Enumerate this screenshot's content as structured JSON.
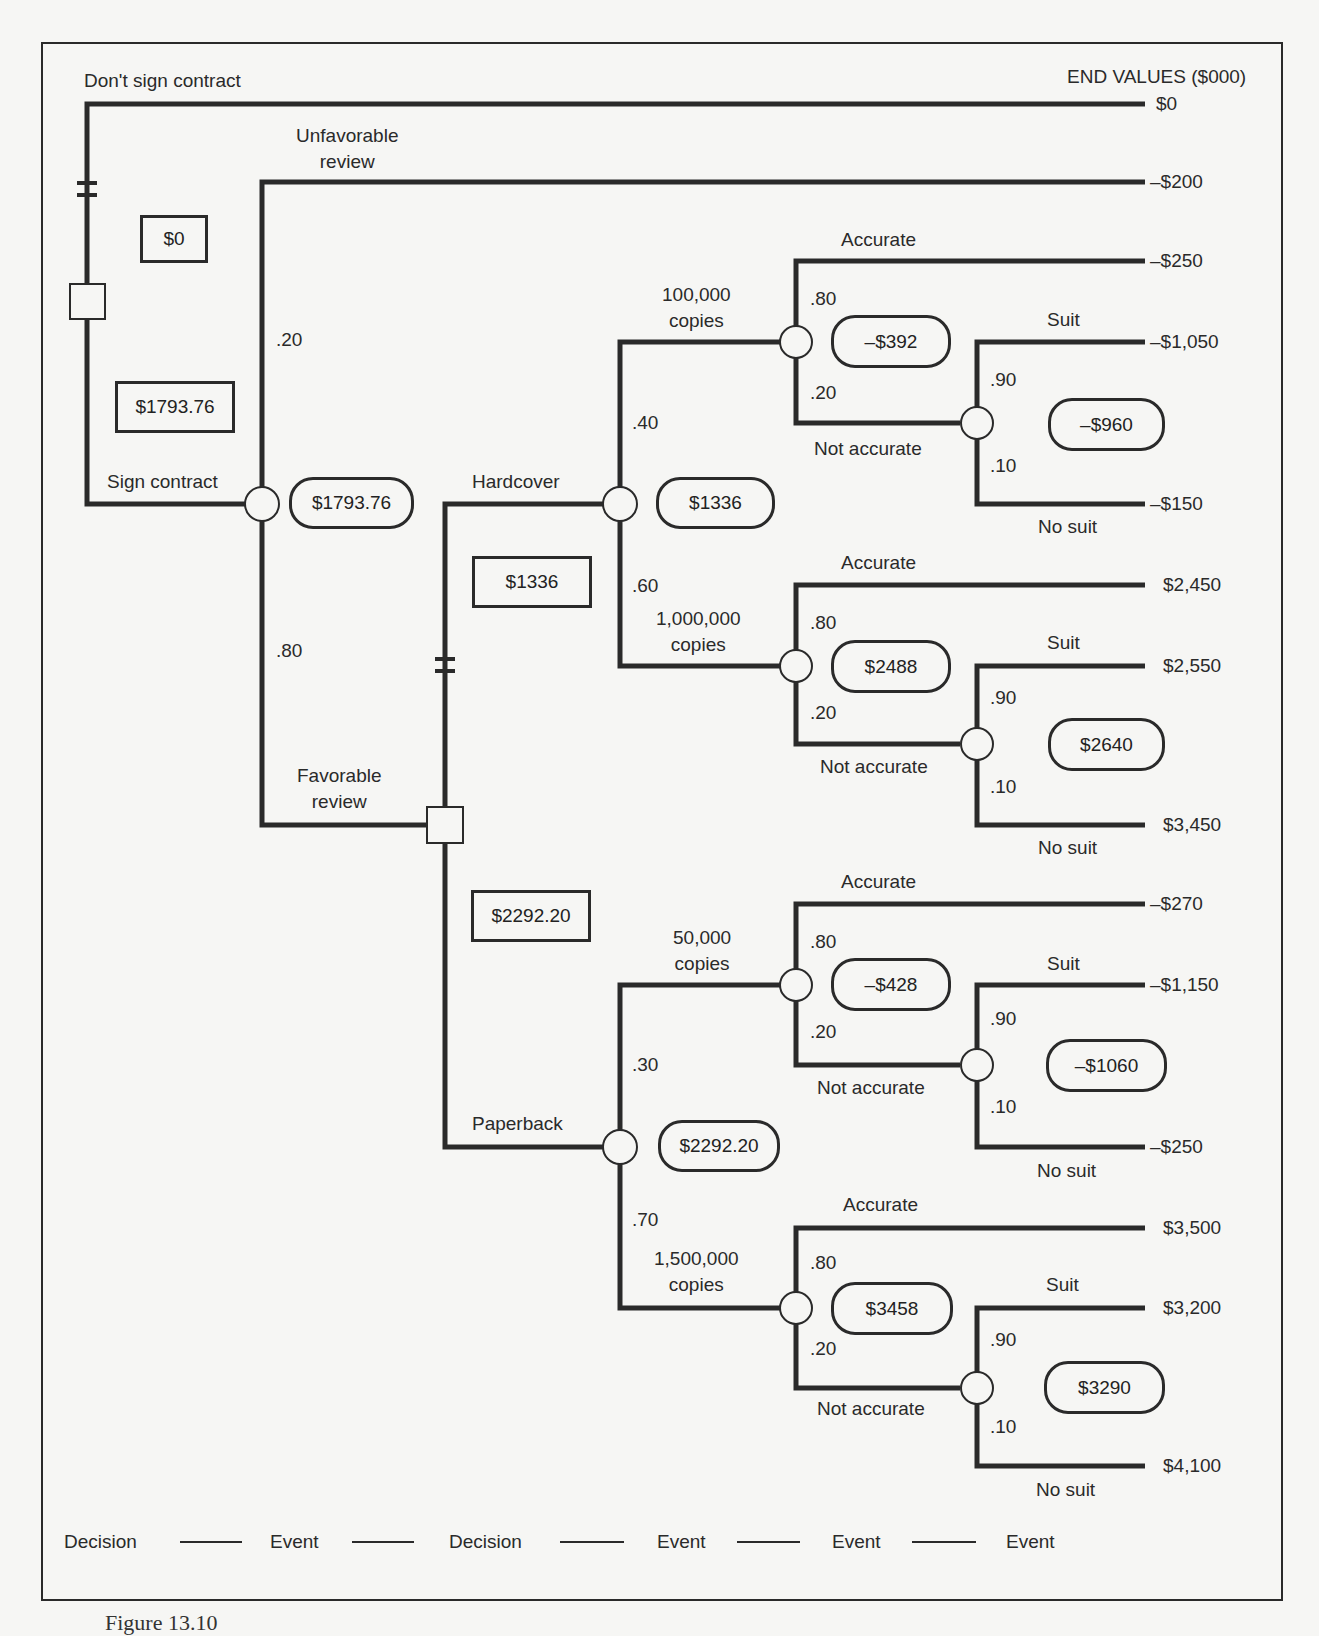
{
  "header": {
    "end_values_title": "END VALUES ($000)"
  },
  "branches": {
    "dont_sign": "Don't sign contract",
    "sign": "Sign contract",
    "unfavorable": "Unfavorable\nreview",
    "favorable": "Favorable\nreview",
    "hardcover": "Hardcover",
    "paperback": "Paperback",
    "hc_100k": "100,000\ncopies",
    "hc_1m": "1,000,000\ncopies",
    "pb_50k": "50,000\ncopies",
    "pb_1_5m": "1,500,000\ncopies",
    "accurate": "Accurate",
    "not_accurate": "Not accurate",
    "suit": "Suit",
    "no_suit": "No suit"
  },
  "probabilities": {
    "unfavorable": ".20",
    "favorable": ".80",
    "hc_100k": ".40",
    "hc_1m": ".60",
    "pb_50k": ".30",
    "pb_1_5m": ".70",
    "accurate": ".80",
    "not_accurate": ".20",
    "suit": ".90",
    "no_suit": ".10"
  },
  "decision_values": {
    "dont_sign": "$0",
    "sign": "$1793.76",
    "hardcover": "$1336",
    "paperback": "$2292.20"
  },
  "event_values": {
    "review": "$1793.76",
    "hardcover": "$1336",
    "paperback": "$2292.20",
    "hc_100k": "–$392",
    "hc_100k_suit": "–$960",
    "hc_1m": "$2488",
    "hc_1m_suit": "$2640",
    "pb_50k": "–$428",
    "pb_50k_suit": "–$1060",
    "pb_1_5m": "$3458",
    "pb_1_5m_suit": "$3290"
  },
  "end_values": [
    "$0",
    "–$200",
    "–$250",
    "–$1,050",
    "–$150",
    "$2,450",
    "$2,550",
    "$3,450",
    "–$270",
    "–$1,150",
    "–$250",
    "$3,500",
    "$3,200",
    "$4,100"
  ],
  "legend": [
    "Decision",
    "Event",
    "Decision",
    "Event",
    "Event",
    "Event"
  ],
  "caption": "Figure 13.10"
}
